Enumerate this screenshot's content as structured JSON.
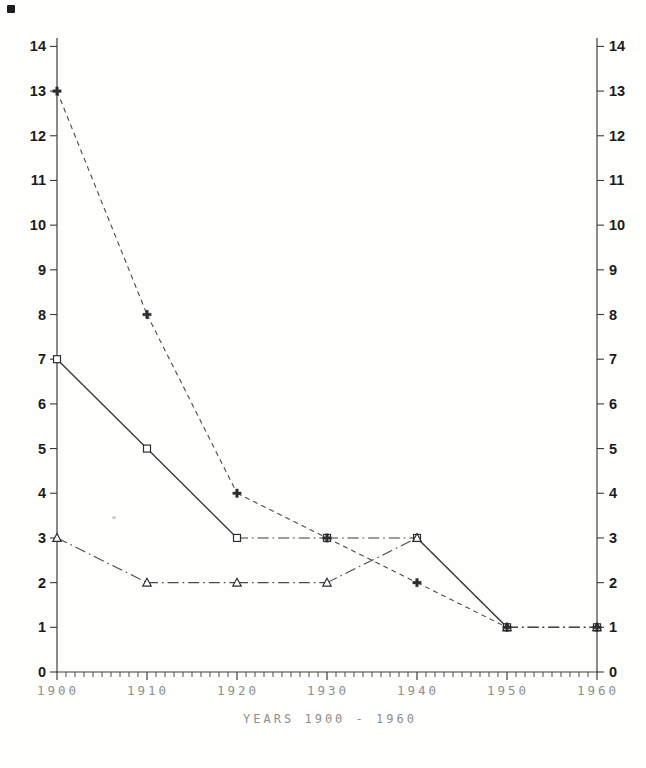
{
  "page": {
    "background": "#fefefd"
  },
  "colors": {
    "axis_ink": "#3c3c3c",
    "line_ink": "#4a4a4a",
    "solid_line_ink": "#383838",
    "marker_ink": "#2d2d2d",
    "y_label_ink": "#1b1b1b",
    "x_label_gray": "#8e8e8c"
  },
  "chart_data": {
    "type": "line",
    "title": "",
    "xlabel": "YEARS 1900 - 1960",
    "ylabel": "",
    "x": [
      1900,
      1910,
      1920,
      1930,
      1940,
      1950,
      1960
    ],
    "x_tick_labels": [
      "1900",
      "1910",
      "1920",
      "1930",
      "1940",
      "1950",
      "1960"
    ],
    "xlim": [
      1900,
      1960
    ],
    "ylim": [
      0,
      14
    ],
    "ytick_step": 1,
    "x_minor_tick_step": 1,
    "grid": false,
    "legend": "none",
    "y_axis_sides": [
      "left",
      "right"
    ],
    "series": [
      {
        "name": "plus-dashed",
        "marker": "plus",
        "line_style": "dashed",
        "values": [
          13,
          8,
          4,
          3,
          2,
          1,
          1
        ]
      },
      {
        "name": "square-solid",
        "marker": "square",
        "line_style": "solid",
        "values": [
          7,
          5,
          3,
          3,
          3,
          1,
          1
        ]
      },
      {
        "name": "triangle-dashdot",
        "marker": "triangle",
        "line_style": "dash-dot",
        "values": [
          3,
          2,
          2,
          2,
          3,
          1,
          1
        ]
      }
    ]
  }
}
